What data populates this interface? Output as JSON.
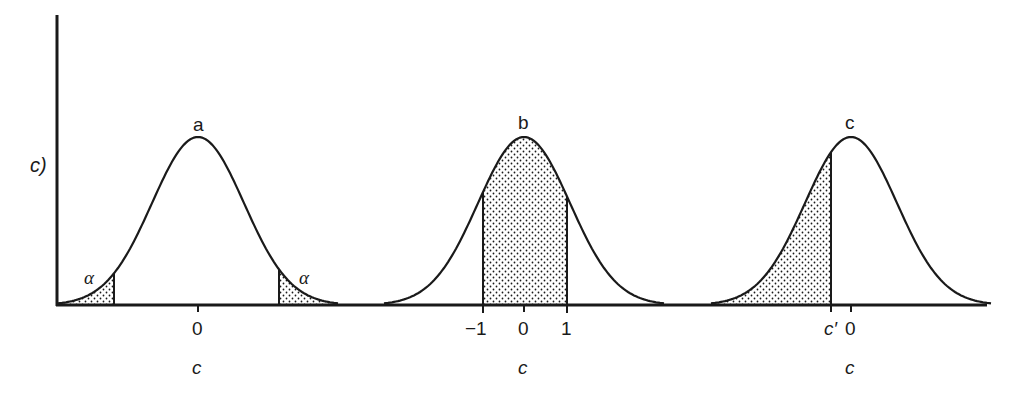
{
  "figure": {
    "y_axis_label": "c)",
    "x_axis_label": "c",
    "colors": {
      "ink": "#1a1a1a",
      "background": "#ffffff"
    },
    "panels": [
      {
        "id": "a",
        "title": "a",
        "center_tick": "0",
        "axis_label": "c",
        "shading": "two tails",
        "tail_labels": [
          "α",
          "α"
        ]
      },
      {
        "id": "b",
        "title": "b",
        "ticks": [
          "−1",
          "0",
          "1"
        ],
        "axis_label": "c",
        "shading": "central region between −1 and 1"
      },
      {
        "id": "c",
        "title": "c",
        "ticks": [
          "c′",
          "0"
        ],
        "axis_label": "c",
        "shading": "left tail up to c′"
      }
    ]
  }
}
